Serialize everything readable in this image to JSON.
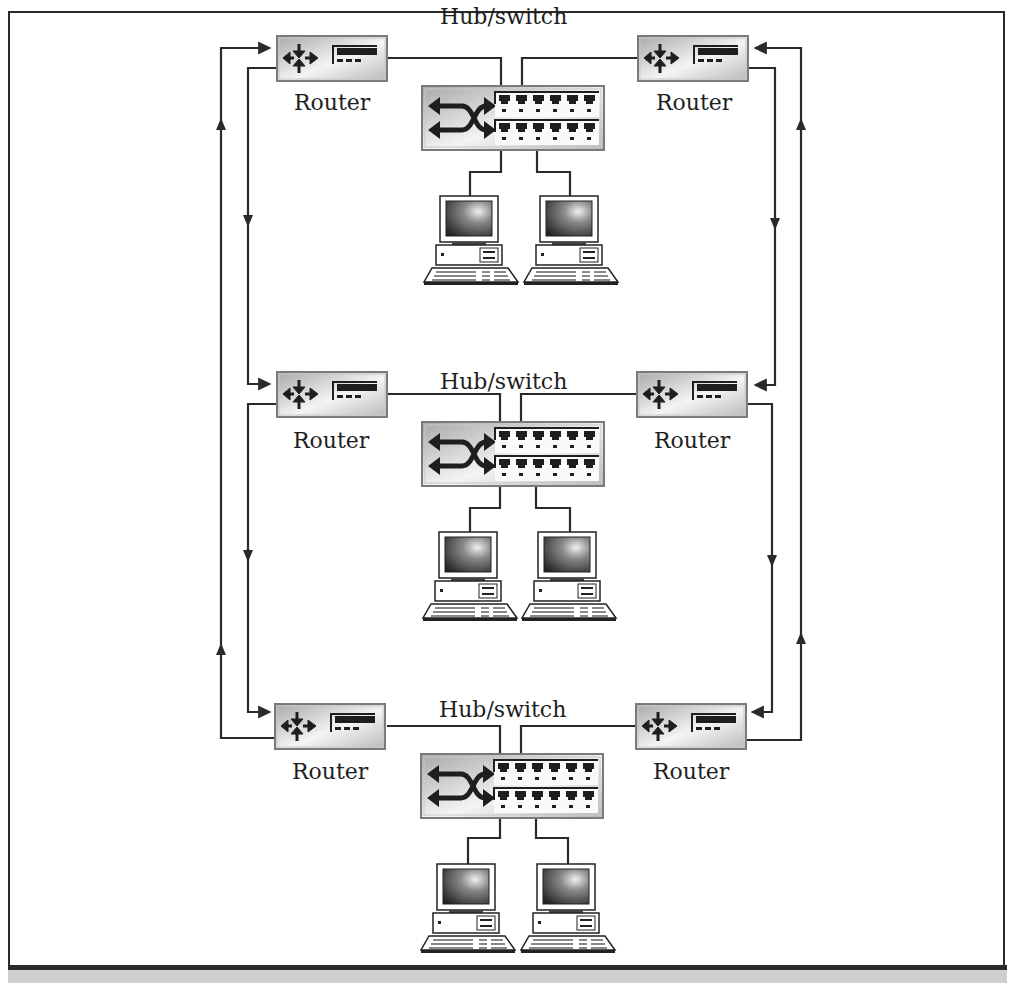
{
  "diagram": {
    "segments": [
      {
        "id": "top",
        "hub_label": "Hub/switch",
        "left_router_label": "Router",
        "right_router_label": "Router",
        "pcs": [
          "pc-1",
          "pc-2"
        ]
      },
      {
        "id": "middle",
        "hub_label": "Hub/switch",
        "left_router_label": "Router",
        "right_router_label": "Router",
        "pcs": [
          "pc-1",
          "pc-2"
        ]
      },
      {
        "id": "bottom",
        "hub_label": "Hub/switch",
        "left_router_label": "Router",
        "right_router_label": "Router",
        "pcs": [
          "pc-1",
          "pc-2"
        ]
      }
    ],
    "icons": {
      "router": "router-icon",
      "hub": "hub-switch-icon",
      "pc": "desktop-computer-icon"
    },
    "colors": {
      "line": "#2a2a2a",
      "device_fill": "#d9d9d9",
      "device_border": "#7a7a7a",
      "caption_strip": "#cfcfcf"
    }
  }
}
